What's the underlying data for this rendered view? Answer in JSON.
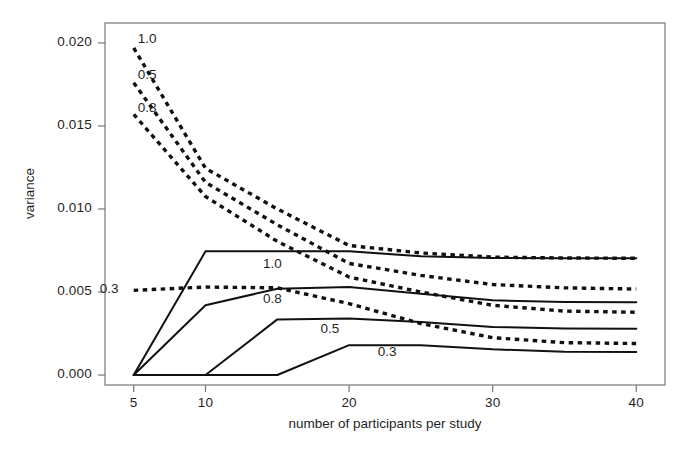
{
  "chart_data": {
    "type": "line",
    "title": "",
    "xlabel": "number of participants per study",
    "ylabel": "variance",
    "xlim": [
      3,
      42
    ],
    "ylim": [
      -0.0006,
      0.0212
    ],
    "xticks": [
      5,
      10,
      20,
      30,
      40
    ],
    "xticklabels": [
      "5",
      "10",
      "20",
      "30",
      "40"
    ],
    "yticks": [
      0.0,
      0.005,
      0.01,
      0.015,
      0.02
    ],
    "yticklabels": [
      "0.000",
      "0.005",
      "0.010",
      "0.015",
      "0.020"
    ],
    "grid": false,
    "legend": "inline-curve-labels",
    "x": [
      5,
      10,
      15,
      20,
      25,
      30,
      35,
      40
    ],
    "series": [
      {
        "name": "1.0 dashed",
        "label": "1.0",
        "style": "dashed",
        "label_x": 5,
        "label_y": 0.0202,
        "label_anchor": "right-of-start",
        "values": [
          0.0197,
          0.01245,
          0.01,
          0.0078,
          0.00735,
          0.0071,
          0.00705,
          0.00703
        ]
      },
      {
        "name": "0.5 dashed",
        "label": "0.5",
        "style": "dashed",
        "label_x": 5,
        "label_y": 0.018,
        "label_anchor": "right-of-start",
        "values": [
          0.0176,
          0.0116,
          0.00905,
          0.00672,
          0.006,
          0.00545,
          0.00525,
          0.00518
        ]
      },
      {
        "name": "0.8 dashed",
        "label": "0.8",
        "style": "dashed",
        "label_x": 5,
        "label_y": 0.016,
        "label_anchor": "right-of-start",
        "values": [
          0.0157,
          0.01075,
          0.00805,
          0.0059,
          0.005,
          0.0042,
          0.00385,
          0.00378
        ]
      },
      {
        "name": "0.3 dashed",
        "label": "0.3",
        "style": "dashed",
        "label_x": 5,
        "label_y": 0.0051,
        "label_anchor": "left-of-start",
        "values": [
          0.0051,
          0.0053,
          0.00525,
          0.0043,
          0.0031,
          0.00225,
          0.00195,
          0.0019
        ]
      },
      {
        "name": "1.0 solid",
        "label": "1.0",
        "style": "solid",
        "label_x": 14,
        "label_y": 0.00665,
        "values": [
          0.0,
          0.00745,
          0.00745,
          0.00745,
          0.00715,
          0.00705,
          0.00703,
          0.00703
        ]
      },
      {
        "name": "0.8 solid",
        "label": "0.8",
        "style": "solid",
        "label_x": 14,
        "label_y": 0.0045,
        "values": [
          0.0,
          0.0042,
          0.0052,
          0.0053,
          0.0049,
          0.0045,
          0.0044,
          0.00438
        ]
      },
      {
        "name": "0.5 solid",
        "label": "0.5",
        "style": "solid",
        "label_x": 18,
        "label_y": 0.0027,
        "values": [
          0.0,
          0.0,
          0.00335,
          0.0034,
          0.0032,
          0.0029,
          0.0028,
          0.00278
        ]
      },
      {
        "name": "0.3 solid",
        "label": "0.3",
        "style": "solid",
        "label_x": 22,
        "label_y": 0.0013,
        "values": [
          0.0,
          0.0,
          0.0,
          0.0018,
          0.0018,
          0.00155,
          0.0014,
          0.00138
        ]
      }
    ],
    "colors": {
      "line": "#111111",
      "axis": "#777777",
      "text": "#1f1f1f",
      "background": "#ffffff"
    }
  }
}
